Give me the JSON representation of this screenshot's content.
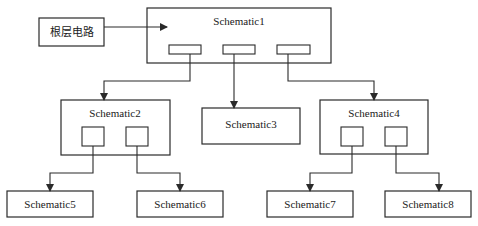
{
  "diagram": {
    "root_input": {
      "label": "根层电路"
    },
    "nodes": [
      {
        "id": "s1",
        "label": "Schematic1"
      },
      {
        "id": "s2",
        "label": "Schematic2"
      },
      {
        "id": "s3",
        "label": "Schematic3"
      },
      {
        "id": "s4",
        "label": "Schematic4"
      },
      {
        "id": "s5",
        "label": "Schematic5"
      },
      {
        "id": "s6",
        "label": "Schematic6"
      },
      {
        "id": "s7",
        "label": "Schematic7"
      },
      {
        "id": "s8",
        "label": "Schematic8"
      }
    ],
    "edges": [
      {
        "from": "root_input",
        "to": "s1"
      },
      {
        "from": "s1",
        "to": "s2"
      },
      {
        "from": "s1",
        "to": "s3"
      },
      {
        "from": "s1",
        "to": "s4"
      },
      {
        "from": "s2",
        "to": "s5"
      },
      {
        "from": "s2",
        "to": "s6"
      },
      {
        "from": "s4",
        "to": "s7"
      },
      {
        "from": "s4",
        "to": "s8"
      }
    ],
    "colors": {
      "stroke": "#2a2a2a",
      "background": "#ffffff"
    }
  }
}
